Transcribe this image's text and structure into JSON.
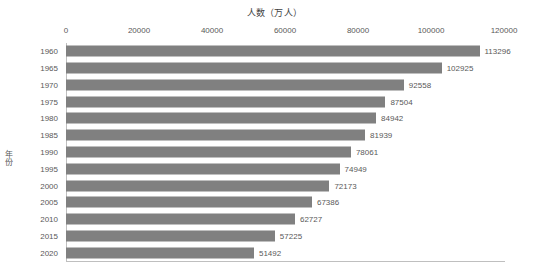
{
  "chart_data": {
    "type": "bar",
    "orientation": "horizontal",
    "title": "人数（万人）",
    "xlabel": "",
    "ylabel": "年份",
    "categories": [
      "1960",
      "1965",
      "1970",
      "1975",
      "1980",
      "1985",
      "1990",
      "1995",
      "2000",
      "2005",
      "2010",
      "2015",
      "2020"
    ],
    "values": [
      113296,
      102925,
      92558,
      87504,
      84942,
      81939,
      78061,
      74949,
      72173,
      67386,
      62727,
      57225,
      51492
    ],
    "data_labels": [
      "113296",
      "102925",
      "92558",
      "87504",
      "84942",
      "81939",
      "78061",
      "74949",
      "72173",
      "67386",
      "62727",
      "57225",
      "51492"
    ],
    "xticks": [
      0,
      20000,
      40000,
      60000,
      80000,
      100000,
      120000
    ],
    "xtick_labels": [
      "0",
      "20000",
      "40000",
      "60000",
      "80000",
      "100000",
      "120000"
    ],
    "xlim": [
      0,
      120000
    ],
    "xaxis_position": "top",
    "grid": false,
    "legend": false,
    "series": [
      {
        "name": "人数（万人）",
        "color": "#808080",
        "values": [
          113296,
          102925,
          92558,
          87504,
          84942,
          81939,
          78061,
          74949,
          72173,
          67386,
          62727,
          57225,
          51492
        ]
      }
    ],
    "colors": {
      "bar": "#808080",
      "axis": "#bfbfbf",
      "text": "#595959",
      "title": "#3f3f3f",
      "background": "#ffffff"
    }
  }
}
